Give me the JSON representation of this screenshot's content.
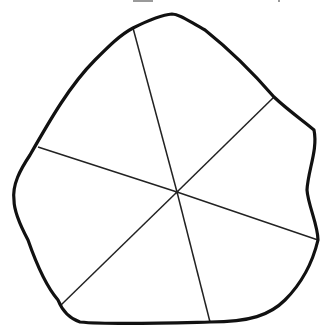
{
  "diagram": {
    "type": "irregular-polygon-divided-into-sectors",
    "outline_color": "#111111",
    "spoke_color": "#222222",
    "background": "#ffffff",
    "center": [
      177,
      192
    ],
    "outline_path": "M 14 200 C 12 185, 20 170, 30 155 C 50 120, 70 85, 95 60 C 110 45, 120 35, 133 28 C 145 22, 160 15, 172 14 C 180 14, 190 22, 205 30 C 230 50, 255 75, 274 97 C 290 112, 305 122, 314 130 C 318 150, 308 170, 307 190 C 308 205, 318 225, 318 240 C 312 265, 300 285, 285 300 C 270 315, 250 322, 210 322 C 170 323, 110 325, 80 322 C 68 318, 62 310, 58 300 C 45 285, 35 260, 28 240 C 20 225, 14 212, 14 200 Z",
    "spokes": [
      {
        "name": "spoke-top",
        "to": [
          133,
          28
        ]
      },
      {
        "name": "spoke-upper-right",
        "to": [
          274,
          97
        ]
      },
      {
        "name": "spoke-lower-right",
        "to": [
          318,
          240
        ]
      },
      {
        "name": "spoke-bottom",
        "to": [
          210,
          322
        ]
      },
      {
        "name": "spoke-lower-left",
        "to": [
          61,
          305
        ]
      },
      {
        "name": "spoke-left",
        "to": [
          38,
          147
        ]
      }
    ],
    "sector_count": 6
  }
}
